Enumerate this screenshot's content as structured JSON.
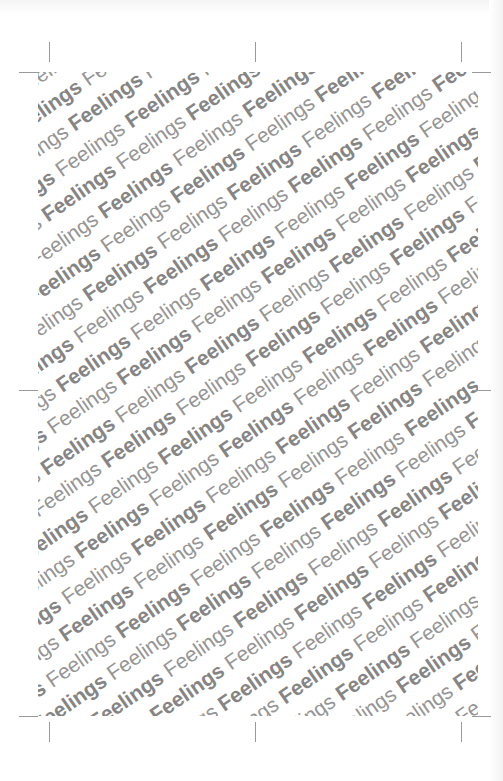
{
  "page": {
    "background": "#ffffff",
    "pattern": {
      "word": "Feelings",
      "styles": [
        "bold",
        "regular"
      ],
      "angle_deg": -35,
      "text_color": "#8a8a8a",
      "rows": 40,
      "words_per_row": 16
    },
    "crop_marks": [
      {
        "id": "top-left-v",
        "orient": "v",
        "x": 49,
        "y": 42
      },
      {
        "id": "top-left-h",
        "orient": "h",
        "x": 19,
        "y": 72
      },
      {
        "id": "top-center-v",
        "orient": "v",
        "x": 255,
        "y": 42
      },
      {
        "id": "top-right-v",
        "orient": "v",
        "x": 461,
        "y": 42
      },
      {
        "id": "top-right-h",
        "orient": "h",
        "x": 472,
        "y": 72
      },
      {
        "id": "mid-left-h",
        "orient": "h",
        "x": 19,
        "y": 390
      },
      {
        "id": "mid-right-h",
        "orient": "h",
        "x": 472,
        "y": 390
      },
      {
        "id": "bottom-left-h",
        "orient": "h",
        "x": 19,
        "y": 716
      },
      {
        "id": "bottom-left-v",
        "orient": "v",
        "x": 49,
        "y": 722
      },
      {
        "id": "bottom-center-v",
        "orient": "v",
        "x": 255,
        "y": 722
      },
      {
        "id": "bottom-right-h",
        "orient": "h",
        "x": 472,
        "y": 716
      },
      {
        "id": "bottom-right-v",
        "orient": "v",
        "x": 461,
        "y": 722
      }
    ]
  }
}
